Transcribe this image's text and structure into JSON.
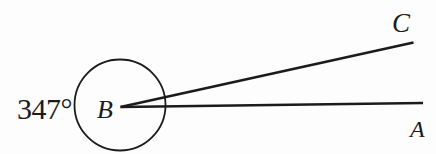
{
  "diagram": {
    "type": "reflex-angle-diagram",
    "angle_label": "347°",
    "vertex_label": "B",
    "ray_c_label": "C",
    "ray_a_label": "A",
    "line_color": "#1b1b1b",
    "background_color": "#fdfdfd"
  }
}
